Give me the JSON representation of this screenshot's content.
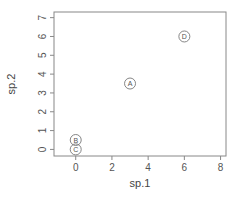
{
  "chart_data": {
    "type": "scatter",
    "title": "",
    "xlabel": "sp.1",
    "ylabel": "sp.2",
    "xlim": [
      -1.2,
      8.3
    ],
    "ylim": [
      -0.35,
      7.3
    ],
    "xticks": [
      0,
      2,
      4,
      6,
      8
    ],
    "yticks": [
      0,
      1,
      2,
      3,
      4,
      5,
      6,
      7
    ],
    "grid": false,
    "legend": null,
    "points": [
      {
        "label": "A",
        "x": 3,
        "y": 3.5
      },
      {
        "label": "B",
        "x": 0,
        "y": 0.5
      },
      {
        "label": "C",
        "x": 0,
        "y": 0
      },
      {
        "label": "D",
        "x": 6,
        "y": 6
      }
    ]
  },
  "style": {
    "axis_color": "#888888",
    "point_color": "#777777",
    "text_color": "#555555"
  }
}
